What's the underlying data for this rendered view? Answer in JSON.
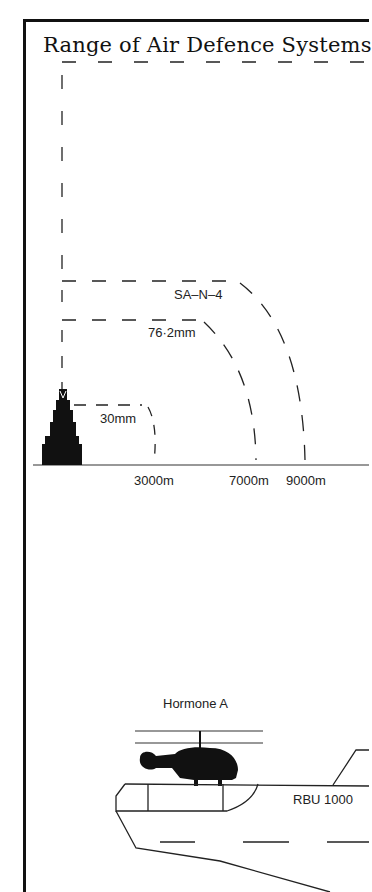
{
  "title": "Range of Air Defence Systems",
  "range_chart": {
    "systems": [
      {
        "name": "SA-N-4",
        "label": "SA–N–4",
        "range": "9000m"
      },
      {
        "name": "76.2mm",
        "label": "76·2mm",
        "range": "7000m"
      },
      {
        "name": "30mm",
        "label": "30mm",
        "range": "3000m"
      }
    ],
    "axis_labels": [
      "3000m",
      "7000m",
      "9000m"
    ]
  },
  "lower_diagram": {
    "helicopter_label": "Hormone A",
    "weapon_label": "RBU 1000"
  }
}
